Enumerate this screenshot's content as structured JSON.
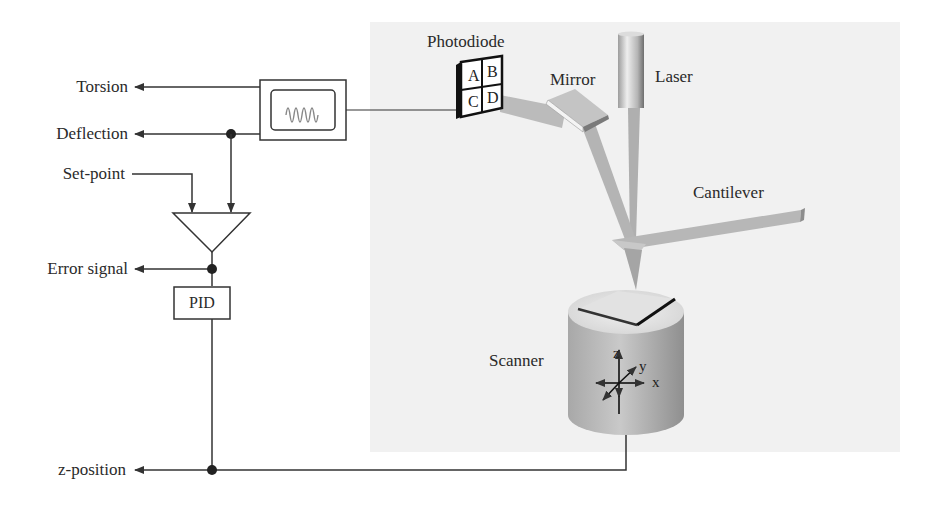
{
  "diagram": {
    "signals": {
      "torsion": "Torsion",
      "deflection": "Deflection",
      "setpoint": "Set-point",
      "error_signal": "Error signal",
      "z_position": "z-position"
    },
    "blocks": {
      "pid": "PID",
      "oscilloscope": "oscilloscope-icon",
      "comparator": "comparator-triangle"
    },
    "components": {
      "photodiode": "Photodiode",
      "mirror": "Mirror",
      "laser": "Laser",
      "cantilever": "Cantilever",
      "scanner": "Scanner"
    },
    "photodiode_quadrants": [
      "A",
      "B",
      "C",
      "D"
    ],
    "scanner_axes": {
      "z": "z",
      "y": "y",
      "x": "x"
    },
    "colors": {
      "line": "#333333",
      "panel_bg": "#f1f1f1",
      "beam": "#9a9a9a",
      "scanner_body": "#b8b8b8"
    }
  }
}
